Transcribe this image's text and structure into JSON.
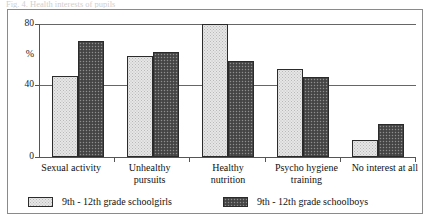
{
  "caption": {
    "text": "Fig. 4.  Health interests of pupils"
  },
  "chart_data": {
    "type": "bar",
    "title": "",
    "xlabel": "",
    "ylabel": "%",
    "ylim": [
      0,
      80
    ],
    "yticks": [
      0,
      40,
      80
    ],
    "ytick_labels": [
      "0",
      "40",
      "80"
    ],
    "grid": true,
    "legend_position": "bottom",
    "categories": [
      "Sexual activity",
      "Unhealthy\npursuits",
      "Healthy\nnutrition",
      "Psycho hygiene\ntraining",
      "No interest at all"
    ],
    "series": [
      {
        "name": "9th - 12th grade schoolgirls",
        "color": "#e6e6e6",
        "values": [
          49,
          61,
          80,
          53,
          10
        ]
      },
      {
        "name": "9th - 12th grade schoolboys",
        "color": "#4f4f4f",
        "values": [
          70,
          63,
          58,
          48,
          20
        ]
      }
    ]
  },
  "axis": {
    "y_label_percent": "%",
    "y_label_80": "80",
    "y_label_40": "40",
    "y_label_0": "0"
  },
  "legend": {
    "entries": [
      {
        "label": "9th - 12th grade schoolgirls"
      },
      {
        "label": "9th - 12th grade schoolboys"
      }
    ]
  }
}
